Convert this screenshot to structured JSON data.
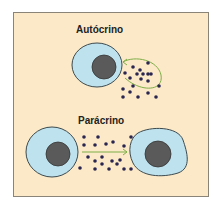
{
  "diagram": {
    "sections": [
      {
        "title": "Autócrino"
      },
      {
        "title": "Parácrino"
      }
    ],
    "colors": {
      "background": "#fbe9c8",
      "cell_fill": "#bfe3ee",
      "cell_border": "#3c4a4f",
      "nucleus": "#5a5a5a",
      "molecule": "#2a2650",
      "arrow": "#7fae47"
    }
  }
}
